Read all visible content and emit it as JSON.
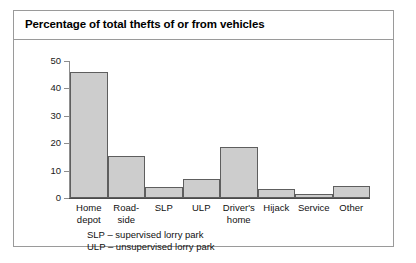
{
  "chart_data": {
    "type": "bar",
    "title": "Percentage of total thefts of or from vehicles",
    "xlabel": "",
    "ylabel": "",
    "ylim": [
      0,
      50
    ],
    "yticks": [
      0,
      10,
      20,
      30,
      40,
      50
    ],
    "ytick_labels": [
      "0",
      "10",
      "20",
      "30",
      "40",
      "50"
    ],
    "grid": false,
    "legend": null,
    "categories": [
      "Home depot",
      "Road-side",
      "SLP",
      "ULP",
      "Driver's home",
      "Hijack",
      "Service",
      "Other"
    ],
    "category_lines": [
      [
        "Home",
        "depot"
      ],
      [
        "Road-",
        "side"
      ],
      [
        "SLP"
      ],
      [
        "ULP"
      ],
      [
        "Driver's",
        "home"
      ],
      [
        "Hijack"
      ],
      [
        "Service"
      ],
      [
        "Other"
      ]
    ],
    "values": [
      46,
      15.5,
      4,
      7,
      18.5,
      3.2,
      1.3,
      4.3
    ],
    "bar_fill_color": "#cdcdcd",
    "bar_border_color": "#5e5e5e",
    "annotations": [
      "SLP – supervised lorry park",
      "ULP – unsupervised lorry park"
    ]
  }
}
